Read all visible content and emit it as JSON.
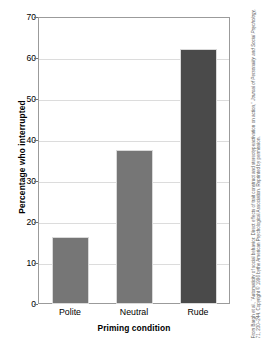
{
  "chart_data": {
    "type": "bar",
    "title": "",
    "categories": [
      "Polite",
      "Neutral",
      "Rude"
    ],
    "values": [
      16.3,
      37.5,
      62.3
    ],
    "series": [
      {
        "name": "Percentage who interrupted",
        "values": [
          16.3,
          37.5,
          62.3
        ]
      }
    ],
    "xlabel": "Priming condition",
    "ylabel": "Percentage who interrupted",
    "ylim": [
      0,
      70
    ],
    "yticks": [
      0,
      10,
      20,
      30,
      40,
      50,
      60,
      70
    ],
    "ytick_labels": [
      "0",
      "10",
      "20",
      "30",
      "40",
      "50",
      "60",
      "70"
    ],
    "grid": true,
    "legend": false,
    "bar_colors": [
      "#767676",
      "#767676",
      "#4a4a4a"
    ]
  },
  "axes": {
    "y_title": "Percentage who interrupted",
    "x_title": "Priming condition"
  },
  "credit": {
    "line_1": "From Bargh et al., “Automaticity of social behavior: Direct effects of trait construct and stereotype",
    "line_2": "activation on action,” ",
    "journal": "Journal of Personality and Social Psychology,",
    "line_3": " 71, 230–244. Copyright © 1996 by",
    "line_4": "the American Psychological Association. Reprinted by permission."
  },
  "colors": {
    "bar_light": "#767676",
    "bar_dark": "#4a4a4a",
    "gridline": "#dcdcdc",
    "frame": "#9b9b9b",
    "text": "#000000",
    "credit_text": "#5d5d5d",
    "background": "#ffffff"
  }
}
